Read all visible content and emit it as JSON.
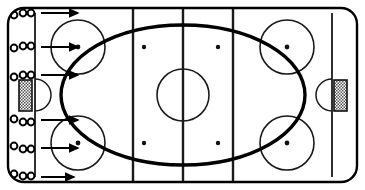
{
  "diagram": {
    "sport": "ice-hockey",
    "view": "overhead-full-rink",
    "colors": {
      "ice": "#ffffff",
      "lines": "#1a1a1a",
      "board_outline": "#000000",
      "goal_net_fill": "#a8a8a8",
      "path_stroke": "#000000"
    }
  },
  "rink": {
    "board": {
      "x": 8,
      "y": 8,
      "width": 349,
      "height": 174,
      "corner_radius": 16,
      "stroke_width": 2.4,
      "label": "rink-boards"
    },
    "surface_label": "ice-surface"
  },
  "lines": [
    {
      "name": "left-goal-line",
      "x": 35,
      "y1": 13,
      "y2": 177,
      "stroke_width": 1.8,
      "label": "Goal Line (Left)"
    },
    {
      "name": "left-blue-line",
      "x": 133,
      "y1": 9,
      "y2": 181,
      "stroke_width": 2.4,
      "label": "Blue Line (Left)"
    },
    {
      "name": "center-red-line",
      "x": 183,
      "y1": 9,
      "y2": 181,
      "stroke_width": 2.4,
      "label": "Center Line"
    },
    {
      "name": "right-blue-line",
      "x": 233,
      "y1": 9,
      "y2": 181,
      "stroke_width": 2.4,
      "label": "Blue Line (Right)"
    },
    {
      "name": "right-goal-line",
      "x": 332,
      "y1": 13,
      "y2": 177,
      "stroke_width": 1.8,
      "label": "Goal Line (Right)"
    }
  ],
  "faceoff_circles": [
    {
      "name": "faceoff-circle-top-left",
      "cx": 78,
      "cy": 47,
      "r": 27,
      "zone": "left-end-zone",
      "dot": true
    },
    {
      "name": "faceoff-circle-bottom-left",
      "cx": 78,
      "cy": 143,
      "r": 27,
      "zone": "left-end-zone",
      "dot": true
    },
    {
      "name": "faceoff-circle-top-right",
      "cx": 287,
      "cy": 47,
      "r": 27,
      "zone": "right-end-zone",
      "dot": true
    },
    {
      "name": "faceoff-circle-bottom-right",
      "cx": 287,
      "cy": 143,
      "r": 27,
      "zone": "right-end-zone",
      "dot": true
    }
  ],
  "center_circle": {
    "name": "center-faceoff-circle",
    "cx": 183,
    "cy": 95,
    "r": 26,
    "stroke_width": 1.6
  },
  "neutral_zone_dots": [
    {
      "name": "neutral-dot-top-left",
      "cx": 144,
      "cy": 47,
      "r": 2.2
    },
    {
      "name": "neutral-dot-top-right",
      "cx": 218,
      "cy": 47,
      "r": 2.2
    },
    {
      "name": "neutral-dot-bottom-left",
      "cx": 144,
      "cy": 143,
      "r": 2.2
    },
    {
      "name": "neutral-dot-bottom-right",
      "cx": 218,
      "cy": 143,
      "r": 2.2
    }
  ],
  "goals": [
    {
      "name": "goal-left",
      "net": {
        "x": 19,
        "y": 80,
        "width": 13,
        "height": 31
      },
      "crease": {
        "cx": 35,
        "cy": 95,
        "r": 16,
        "facing": "right"
      }
    },
    {
      "name": "goal-right",
      "net": {
        "x": 334,
        "y": 80,
        "width": 13,
        "height": 31
      },
      "crease": {
        "cx": 332,
        "cy": 95,
        "r": 16,
        "facing": "left"
      }
    }
  ],
  "skating_path": {
    "name": "skating-path-ellipse",
    "type": "ellipse",
    "cx": 183,
    "cy": 95,
    "rx": 122,
    "ry": 70,
    "stroke_width": 3.4,
    "description": "Large oval skating route around the rink"
  },
  "player_groups": [
    {
      "name": "player-group-1",
      "label": "Group 1",
      "players": [
        {
          "cx": 14,
          "cy": 15,
          "r": 3.4
        },
        {
          "cx": 23,
          "cy": 13,
          "r": 3.4
        },
        {
          "cx": 31,
          "cy": 13,
          "r": 3.4
        }
      ],
      "arrow": {
        "x1": 41,
        "y1": 13,
        "x2": 78,
        "y2": 13
      }
    },
    {
      "name": "player-group-2",
      "label": "Group 2",
      "players": [
        {
          "cx": 14,
          "cy": 48,
          "r": 3.4
        },
        {
          "cx": 23,
          "cy": 46,
          "r": 3.4
        },
        {
          "cx": 31,
          "cy": 46,
          "r": 3.4
        }
      ],
      "arrow": {
        "x1": 41,
        "y1": 47,
        "x2": 78,
        "y2": 47
      }
    },
    {
      "name": "player-group-3",
      "label": "Group 3",
      "players": [
        {
          "cx": 14,
          "cy": 77,
          "r": 3.4
        },
        {
          "cx": 23,
          "cy": 75,
          "r": 3.4
        },
        {
          "cx": 31,
          "cy": 75,
          "r": 3.4
        }
      ],
      "arrow": {
        "x1": 41,
        "y1": 75,
        "x2": 78,
        "y2": 75
      }
    },
    {
      "name": "player-group-4",
      "label": "Group 4",
      "players": [
        {
          "cx": 14,
          "cy": 119,
          "r": 3.4
        },
        {
          "cx": 23,
          "cy": 122,
          "r": 3.4
        },
        {
          "cx": 31,
          "cy": 122,
          "r": 3.4
        }
      ],
      "arrow": {
        "x1": 41,
        "y1": 120,
        "x2": 78,
        "y2": 120
      }
    },
    {
      "name": "player-group-5",
      "label": "Group 5",
      "players": [
        {
          "cx": 14,
          "cy": 146,
          "r": 3.4
        },
        {
          "cx": 23,
          "cy": 149,
          "r": 3.4
        },
        {
          "cx": 31,
          "cy": 149,
          "r": 3.4
        }
      ],
      "arrow": {
        "x1": 41,
        "y1": 148,
        "x2": 78,
        "y2": 148
      }
    },
    {
      "name": "player-group-6",
      "label": "Group 6",
      "players": [
        {
          "cx": 14,
          "cy": 174,
          "r": 3.4
        },
        {
          "cx": 23,
          "cy": 176,
          "r": 3.4
        },
        {
          "cx": 31,
          "cy": 176,
          "r": 3.4
        }
      ],
      "arrow": {
        "x1": 41,
        "y1": 177,
        "x2": 74,
        "y2": 177
      }
    }
  ]
}
